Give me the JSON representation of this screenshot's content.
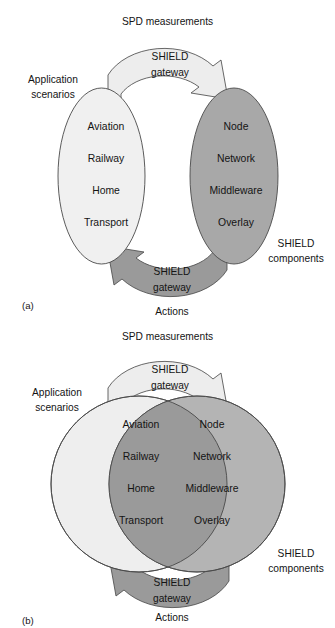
{
  "figures": [
    {
      "id": "a",
      "caption": "(a)",
      "top_edge_label": "SPD measurements",
      "bottom_edge_label": "Actions",
      "top_arrow_label_line1": "SHIELD",
      "top_arrow_label_line2": "gateway",
      "bottom_arrow_label_line1": "SHIELD",
      "bottom_arrow_label_line2": "gateway",
      "left_group_label_line1": "Application",
      "left_group_label_line2": "scenarios",
      "right_group_label_line1": "SHIELD",
      "right_group_label_line2": "components",
      "left_items": [
        "Aviation",
        "Railway",
        "Home",
        "Transport"
      ],
      "right_items": [
        "Node",
        "Network",
        "Middleware",
        "Overlay"
      ],
      "colors": {
        "left_fill": "#f0f0f0",
        "right_fill": "#a8a8a8",
        "overlap_fill": "#a8a8a8",
        "top_arrow_fill": "#ededed",
        "bottom_arrow_fill": "#9a9a9a",
        "outline": "#4a4a4a",
        "text": "#141414"
      },
      "overlapping": false
    },
    {
      "id": "b",
      "caption": "(b)",
      "top_edge_label": "SPD measurements",
      "bottom_edge_label": "Actions",
      "top_arrow_label_line1": "SHIELD",
      "top_arrow_label_line2": "gateway",
      "bottom_arrow_label_line1": "SHIELD",
      "bottom_arrow_label_line2": "gateway",
      "left_group_label_line1": "Application",
      "left_group_label_line2": "scenarios",
      "right_group_label_line1": "SHIELD",
      "right_group_label_line2": "components",
      "left_items": [
        "Aviation",
        "Railway",
        "Home",
        "Transport"
      ],
      "right_items": [
        "Node",
        "Network",
        "Middleware",
        "Overlay"
      ],
      "colors": {
        "left_fill": "#eeeeee",
        "right_fill": "#b4b4b4",
        "overlap_fill": "#9a9a9a",
        "top_arrow_fill": "#ededed",
        "bottom_arrow_fill": "#9a9a9a",
        "outline": "#4a4a4a",
        "text": "#141414"
      },
      "overlapping": true
    }
  ]
}
